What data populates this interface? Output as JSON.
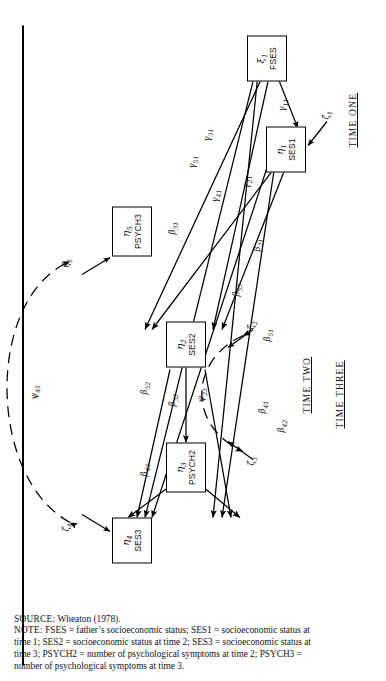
{
  "figure": {
    "nodes": [
      {
        "id": "fses",
        "sym": "ξ",
        "sub": "1",
        "name": "FSES"
      },
      {
        "id": "ses1",
        "sym": "η",
        "sub": "1",
        "name": "SES1"
      },
      {
        "id": "ses2",
        "sym": "η",
        "sub": "2",
        "name": "SES2"
      },
      {
        "id": "psych2",
        "sym": "η",
        "sub": "3",
        "name": "PSYCH2"
      },
      {
        "id": "ses3",
        "sym": "η",
        "sub": "4",
        "name": "SES3"
      },
      {
        "id": "psych3",
        "sym": "η",
        "sub": "5",
        "name": "PSYCH3"
      }
    ],
    "disturbances": [
      {
        "id": "z1",
        "sym": "ζ",
        "sub": "1"
      },
      {
        "id": "z2",
        "sym": "ζ",
        "sub": "2"
      },
      {
        "id": "z3",
        "sym": "ζ",
        "sub": "3"
      },
      {
        "id": "z4",
        "sym": "ζ",
        "sub": "4"
      },
      {
        "id": "z5",
        "sym": "ζ",
        "sub": "5"
      }
    ],
    "path_labels": [
      {
        "id": "g11",
        "sym": "γ",
        "sub": "11"
      },
      {
        "id": "g21",
        "sym": "γ",
        "sub": "21"
      },
      {
        "id": "g31",
        "sym": "γ",
        "sub": "31"
      },
      {
        "id": "g41",
        "sym": "γ",
        "sub": "41"
      },
      {
        "id": "g51",
        "sym": "γ",
        "sub": "51"
      },
      {
        "id": "b21",
        "sym": "β",
        "sub": "21"
      },
      {
        "id": "b31",
        "sym": "β",
        "sub": "31"
      },
      {
        "id": "b32",
        "sym": "β",
        "sub": "32"
      },
      {
        "id": "b41",
        "sym": "β",
        "sub": "41"
      },
      {
        "id": "b42",
        "sym": "β",
        "sub": "42"
      },
      {
        "id": "b43",
        "sym": "β",
        "sub": "43"
      },
      {
        "id": "b51",
        "sym": "β",
        "sub": "51"
      },
      {
        "id": "b52",
        "sym": "β",
        "sub": "52"
      },
      {
        "id": "b53",
        "sym": "β",
        "sub": "53"
      }
    ],
    "covariance_labels": [
      {
        "id": "psi23",
        "sym": "ψ",
        "sub": "23"
      },
      {
        "id": "psi45",
        "sym": "ψ",
        "sub": "45"
      }
    ],
    "time_labels": [
      {
        "id": "time-one",
        "text": "TIME ONE"
      },
      {
        "id": "time-two",
        "text": "TIME TWO"
      },
      {
        "id": "time-three",
        "text": "TIME THREE"
      }
    ]
  },
  "caption": {
    "source_label": "SOURCE:",
    "source_text": " Wheaton (1978).",
    "note_label": "NOTE:",
    "note_text": " FSES = father’s socioeconomic status; SES1 = socioeconomic status at time 1; SES2 = socioeconomic status at time 2; SES3 = socioeconomic status at time 3; PSYCH2 = number of psychological symptoms at time 2; PSYCH3 = number of psychological symptoms at time 3."
  }
}
